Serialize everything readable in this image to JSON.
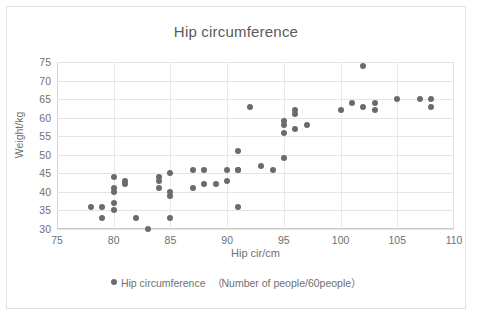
{
  "chart_data": {
    "type": "scatter",
    "title": "Hip circumference",
    "xlabel": "Hip cir/cm",
    "ylabel": "Weight/kg",
    "xlim": [
      75,
      110
    ],
    "ylim": [
      30,
      75
    ],
    "xticks": [
      75,
      80,
      85,
      90,
      95,
      100,
      105,
      110
    ],
    "yticks": [
      30,
      35,
      40,
      45,
      50,
      55,
      60,
      65,
      70,
      75
    ],
    "grid": true,
    "legend_position": "bottom",
    "series": [
      {
        "name": "Hip circumference",
        "note": "（Number of people/60people）",
        "marker_color": "#6b6b6b",
        "points": [
          [
            78,
            36
          ],
          [
            79,
            36
          ],
          [
            79,
            33
          ],
          [
            80,
            44
          ],
          [
            80,
            41
          ],
          [
            80,
            40
          ],
          [
            80,
            37
          ],
          [
            80,
            35
          ],
          [
            81,
            43
          ],
          [
            81,
            42
          ],
          [
            82,
            33
          ],
          [
            83,
            30
          ],
          [
            84,
            44
          ],
          [
            84,
            43
          ],
          [
            84,
            41
          ],
          [
            85,
            45
          ],
          [
            85,
            40
          ],
          [
            85,
            39
          ],
          [
            85,
            33
          ],
          [
            87,
            46
          ],
          [
            87,
            41
          ],
          [
            88,
            46
          ],
          [
            88,
            42
          ],
          [
            89,
            42
          ],
          [
            90,
            46
          ],
          [
            90,
            43
          ],
          [
            91,
            51
          ],
          [
            91,
            46
          ],
          [
            91,
            46
          ],
          [
            91,
            36
          ],
          [
            92,
            63
          ],
          [
            93,
            47
          ],
          [
            94,
            46
          ],
          [
            95,
            59
          ],
          [
            95,
            58
          ],
          [
            95,
            56
          ],
          [
            95,
            49
          ],
          [
            96,
            62
          ],
          [
            96,
            61
          ],
          [
            96,
            57
          ],
          [
            97,
            58
          ],
          [
            100,
            62
          ],
          [
            101,
            64
          ],
          [
            102,
            74
          ],
          [
            102,
            63
          ],
          [
            103,
            64
          ],
          [
            103,
            62
          ],
          [
            105,
            65
          ],
          [
            107,
            65
          ],
          [
            108,
            65
          ],
          [
            108,
            63
          ]
        ]
      }
    ]
  },
  "legend": {
    "marker_icon": "filled-circle-icon"
  }
}
